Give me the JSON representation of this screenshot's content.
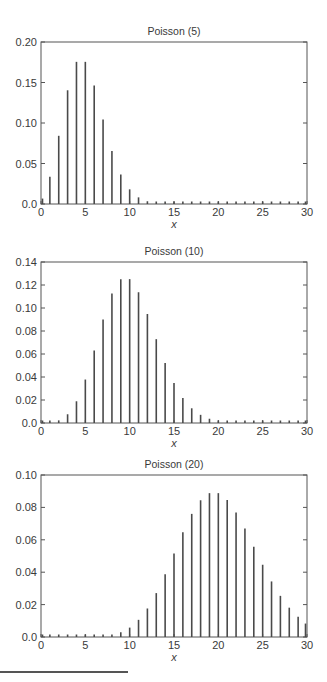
{
  "chart_data": [
    {
      "type": "bar",
      "title": "Poisson (5)",
      "xlabel": "x",
      "ylabel": "",
      "xlim": [
        0,
        30
      ],
      "ylim": [
        0,
        0.2
      ],
      "xticks": [
        0,
        5,
        10,
        15,
        20,
        25,
        30
      ],
      "yticks": [
        0.0,
        0.05,
        0.1,
        0.15,
        0.2
      ],
      "ytick_labels": [
        "0.0",
        "0.05",
        "0.10",
        "0.15",
        "0.20"
      ],
      "x": [
        0,
        1,
        2,
        3,
        4,
        5,
        6,
        7,
        8,
        9,
        10,
        11,
        12,
        13,
        14,
        15,
        16,
        17,
        18,
        19,
        20,
        21,
        22,
        23,
        24,
        25,
        26,
        27,
        28,
        29,
        30
      ],
      "values": [
        0.0067,
        0.0337,
        0.0842,
        0.1404,
        0.1755,
        0.1755,
        0.1462,
        0.1044,
        0.0653,
        0.0363,
        0.0181,
        0.0082,
        0.0034,
        0.0013,
        0.0005,
        0.0002,
        0.0,
        0.0,
        0.0,
        0.0,
        0.0,
        0.0,
        0.0,
        0.0,
        0.0,
        0.0,
        0.0,
        0.0,
        0.0,
        0.0,
        0.0
      ],
      "grid": false
    },
    {
      "type": "bar",
      "title": "Poisson (10)",
      "xlabel": "x",
      "ylabel": "",
      "xlim": [
        0,
        30
      ],
      "ylim": [
        0,
        0.14
      ],
      "xticks": [
        0,
        5,
        10,
        15,
        20,
        25,
        30
      ],
      "yticks": [
        0.0,
        0.02,
        0.04,
        0.06,
        0.08,
        0.1,
        0.12,
        0.14
      ],
      "ytick_labels": [
        "0.0",
        "0.02",
        "0.04",
        "0.06",
        "0.08",
        "0.10",
        "0.12",
        "0.14"
      ],
      "x": [
        0,
        1,
        2,
        3,
        4,
        5,
        6,
        7,
        8,
        9,
        10,
        11,
        12,
        13,
        14,
        15,
        16,
        17,
        18,
        19,
        20,
        21,
        22,
        23,
        24,
        25,
        26,
        27,
        28,
        29,
        30
      ],
      "values": [
        0.0,
        0.0005,
        0.0023,
        0.0076,
        0.0189,
        0.0378,
        0.0631,
        0.0901,
        0.1126,
        0.1251,
        0.1251,
        0.1137,
        0.0948,
        0.0729,
        0.0521,
        0.0347,
        0.0217,
        0.0128,
        0.0071,
        0.0037,
        0.0019,
        0.0009,
        0.0004,
        0.0002,
        0.0001,
        0.0,
        0.0,
        0.0,
        0.0,
        0.0,
        0.0
      ],
      "grid": false
    },
    {
      "type": "bar",
      "title": "Poisson (20)",
      "xlabel": "x",
      "ylabel": "",
      "xlim": [
        0,
        30
      ],
      "ylim": [
        0,
        0.1
      ],
      "xticks": [
        0,
        5,
        10,
        15,
        20,
        25,
        30
      ],
      "yticks": [
        0.0,
        0.02,
        0.04,
        0.06,
        0.08,
        0.1
      ],
      "ytick_labels": [
        "0.0",
        "0.02",
        "0.04",
        "0.06",
        "0.08",
        "0.10"
      ],
      "x": [
        0,
        1,
        2,
        3,
        4,
        5,
        6,
        7,
        8,
        9,
        10,
        11,
        12,
        13,
        14,
        15,
        16,
        17,
        18,
        19,
        20,
        21,
        22,
        23,
        24,
        25,
        26,
        27,
        28,
        29,
        30
      ],
      "values": [
        0.0,
        0.0,
        0.0,
        0.0,
        0.0,
        0.0001,
        0.0002,
        0.0005,
        0.0013,
        0.0029,
        0.0058,
        0.0106,
        0.0176,
        0.0271,
        0.0387,
        0.0516,
        0.0646,
        0.076,
        0.0844,
        0.0888,
        0.0888,
        0.0846,
        0.0769,
        0.0669,
        0.0557,
        0.0446,
        0.0343,
        0.0254,
        0.0181,
        0.0125,
        0.0083
      ],
      "grid": false
    }
  ]
}
